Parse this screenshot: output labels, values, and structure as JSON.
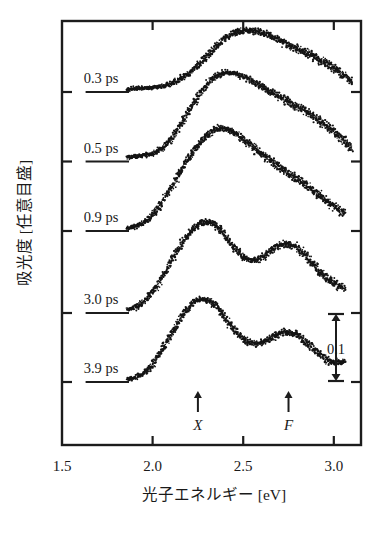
{
  "chart_data": {
    "type": "line",
    "title": "",
    "xlabel": "光子エネルギー [eV]",
    "ylabel": "吸光度 [任意目盛]",
    "xlim": [
      1.5,
      3.15
    ],
    "xticks": [
      1.5,
      2.0,
      2.5,
      3.0
    ],
    "xticklabels": [
      "1.5",
      "2.0",
      "2.5",
      "3.0"
    ],
    "ytick_count": 5,
    "ytick_labels_shown": false,
    "grid": false,
    "legend": "none",
    "offset_stacked": true,
    "scale_bar": {
      "label": "0.1",
      "value": 0.1,
      "units": "absorbance"
    },
    "annotations": [
      {
        "label": "X",
        "x": 2.25,
        "kind": "arrow-up"
      },
      {
        "label": "F",
        "x": 2.75,
        "kind": "arrow-up"
      }
    ],
    "series": [
      {
        "name": "0.3 ps",
        "label": "0.3 ps",
        "baseline_label_x": 1.62,
        "x": [
          1.86,
          1.9,
          1.94,
          1.98,
          2.02,
          2.06,
          2.1,
          2.14,
          2.18,
          2.22,
          2.26,
          2.3,
          2.34,
          2.38,
          2.42,
          2.46,
          2.5,
          2.54,
          2.58,
          2.62,
          2.66,
          2.7,
          2.74,
          2.78,
          2.82,
          2.86,
          2.9,
          2.94,
          2.98,
          3.02,
          3.06,
          3.1
        ],
        "y": [
          0.004,
          0.005,
          0.006,
          0.006,
          0.007,
          0.009,
          0.012,
          0.017,
          0.023,
          0.031,
          0.041,
          0.052,
          0.063,
          0.073,
          0.081,
          0.086,
          0.089,
          0.089,
          0.087,
          0.084,
          0.08,
          0.075,
          0.07,
          0.065,
          0.06,
          0.055,
          0.05,
          0.044,
          0.038,
          0.031,
          0.024,
          0.016
        ]
      },
      {
        "name": "0.5 ps",
        "label": "0.5 ps",
        "baseline_label_x": 1.62,
        "x": [
          1.86,
          1.9,
          1.94,
          1.98,
          2.02,
          2.06,
          2.1,
          2.14,
          2.18,
          2.22,
          2.26,
          2.3,
          2.34,
          2.38,
          2.42,
          2.46,
          2.5,
          2.54,
          2.58,
          2.62,
          2.66,
          2.7,
          2.74,
          2.78,
          2.82,
          2.86,
          2.9,
          2.94,
          2.98,
          3.02,
          3.06,
          3.1
        ],
        "y": [
          0.006,
          0.007,
          0.008,
          0.01,
          0.014,
          0.021,
          0.032,
          0.047,
          0.064,
          0.082,
          0.098,
          0.111,
          0.121,
          0.127,
          0.129,
          0.127,
          0.123,
          0.118,
          0.112,
          0.106,
          0.1,
          0.094,
          0.088,
          0.082,
          0.076,
          0.07,
          0.063,
          0.056,
          0.048,
          0.039,
          0.029,
          0.018
        ]
      },
      {
        "name": "0.9 ps",
        "label": "0.9 ps",
        "baseline_label_x": 1.62,
        "x": [
          1.86,
          1.9,
          1.94,
          1.98,
          2.02,
          2.06,
          2.1,
          2.14,
          2.18,
          2.22,
          2.26,
          2.3,
          2.34,
          2.38,
          2.42,
          2.46,
          2.5,
          2.54,
          2.58,
          2.62,
          2.66,
          2.7,
          2.74,
          2.78,
          2.82,
          2.86,
          2.9,
          2.94,
          2.98,
          3.02,
          3.06
        ],
        "y": [
          0.004,
          0.006,
          0.01,
          0.018,
          0.03,
          0.045,
          0.062,
          0.08,
          0.098,
          0.114,
          0.128,
          0.139,
          0.146,
          0.149,
          0.147,
          0.141,
          0.133,
          0.125,
          0.117,
          0.109,
          0.101,
          0.093,
          0.086,
          0.078,
          0.071,
          0.064,
          0.056,
          0.048,
          0.04,
          0.032,
          0.026
        ]
      },
      {
        "name": "3.0 ps",
        "label": "3.0 ps",
        "baseline_label_x": 1.62,
        "x": [
          1.86,
          1.9,
          1.94,
          1.98,
          2.02,
          2.06,
          2.1,
          2.14,
          2.18,
          2.22,
          2.26,
          2.3,
          2.34,
          2.38,
          2.42,
          2.46,
          2.5,
          2.54,
          2.58,
          2.62,
          2.66,
          2.7,
          2.74,
          2.78,
          2.82,
          2.86,
          2.9,
          2.94,
          2.98,
          3.02,
          3.06
        ],
        "y": [
          0.005,
          0.008,
          0.014,
          0.024,
          0.038,
          0.055,
          0.073,
          0.091,
          0.107,
          0.12,
          0.129,
          0.132,
          0.128,
          0.118,
          0.105,
          0.092,
          0.082,
          0.077,
          0.078,
          0.084,
          0.092,
          0.098,
          0.1,
          0.097,
          0.089,
          0.078,
          0.066,
          0.055,
          0.046,
          0.04,
          0.036
        ]
      },
      {
        "name": "3.9 ps",
        "label": "3.9 ps",
        "baseline_label_x": 1.62,
        "x": [
          1.86,
          1.9,
          1.94,
          1.98,
          2.02,
          2.06,
          2.1,
          2.14,
          2.18,
          2.22,
          2.26,
          2.3,
          2.34,
          2.38,
          2.42,
          2.46,
          2.5,
          2.54,
          2.58,
          2.62,
          2.66,
          2.7,
          2.74,
          2.78,
          2.82,
          2.86,
          2.9,
          2.94,
          2.98,
          3.02,
          3.06
        ],
        "y": [
          0.004,
          0.006,
          0.011,
          0.02,
          0.033,
          0.05,
          0.068,
          0.086,
          0.102,
          0.114,
          0.12,
          0.119,
          0.112,
          0.1,
          0.086,
          0.073,
          0.063,
          0.057,
          0.056,
          0.059,
          0.065,
          0.07,
          0.072,
          0.07,
          0.064,
          0.055,
          0.045,
          0.036,
          0.03,
          0.028,
          0.03
        ]
      }
    ]
  },
  "axis": {
    "xlabel": "光子エネルギー [eV]",
    "ylabel": "吸光度 [任意目盛]",
    "xticklabels": [
      "1.5",
      "2.0",
      "2.5",
      "3.0"
    ]
  },
  "scalebar": {
    "label": "0.1"
  },
  "peaks": {
    "x_label": "X",
    "f_label": "F"
  }
}
